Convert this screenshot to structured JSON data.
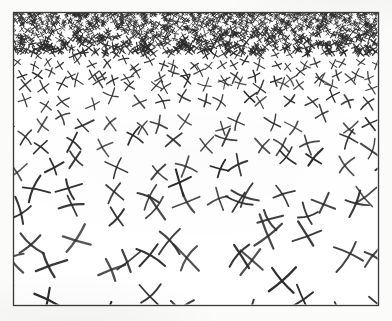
{
  "figure": {
    "medium": "pen-and-ink drawing, scanned",
    "canvas": {
      "width": 392,
      "height": 321
    },
    "background_color": "#fbfbf9",
    "ink_color": "#2b2b2b"
  },
  "frame": {
    "label": "drawing-border",
    "x": 13,
    "y": 12,
    "width": 365,
    "height": 293,
    "stroke_color": "#3a3a3a",
    "stroke_width": 1.3,
    "fill_color": "#ffffff"
  },
  "chart_data": {
    "type": "scatter",
    "subtitle": "X-mark density and size gradient",
    "xlabel": "",
    "ylabel": "",
    "xlim": [
      0,
      1
    ],
    "ylim": [
      0,
      1
    ],
    "grid": false,
    "legend": "none",
    "marker": "x-cross",
    "annotations": [
      "Marks are smallest and most densely packed along the top edge",
      "Marks are largest and most widely spaced along the bottom edge",
      "Mark size varies smoothly with vertical position",
      "Bottom-row marks are clipped by the frame border"
    ],
    "gradient_bands": [
      {
        "band": 1,
        "y_top": 13,
        "y_bottom": 48,
        "mark_size_px": 5,
        "row_spacing_px": 6,
        "col_spacing_px": 7,
        "stroke_width": 0.9,
        "marks_per_row": 54
      },
      {
        "band": 2,
        "y_top": 48,
        "y_bottom": 78,
        "mark_size_px": 8,
        "row_spacing_px": 10,
        "col_spacing_px": 11,
        "stroke_width": 1.1,
        "marks_per_row": 34
      },
      {
        "band": 3,
        "y_top": 78,
        "y_bottom": 112,
        "mark_size_px": 12,
        "row_spacing_px": 15,
        "col_spacing_px": 17,
        "stroke_width": 1.3,
        "marks_per_row": 22
      },
      {
        "band": 4,
        "y_top": 112,
        "y_bottom": 152,
        "mark_size_px": 16,
        "row_spacing_px": 21,
        "col_spacing_px": 24,
        "stroke_width": 1.5,
        "marks_per_row": 16
      },
      {
        "band": 5,
        "y_top": 152,
        "y_bottom": 198,
        "mark_size_px": 20,
        "row_spacing_px": 27,
        "col_spacing_px": 31,
        "stroke_width": 1.7,
        "marks_per_row": 12
      },
      {
        "band": 6,
        "y_top": 198,
        "y_bottom": 250,
        "mark_size_px": 25,
        "row_spacing_px": 33,
        "col_spacing_px": 39,
        "stroke_width": 1.9,
        "marks_per_row": 10
      },
      {
        "band": 7,
        "y_top": 250,
        "y_bottom": 312,
        "mark_size_px": 30,
        "row_spacing_px": 39,
        "col_spacing_px": 46,
        "stroke_width": 2.1,
        "marks_per_row": 8
      }
    ],
    "size_profile": {
      "note": "mark size in px as a function of normalized depth t (0 = top edge, 1 = bottom edge)",
      "t": [
        0.0,
        0.15,
        0.3,
        0.45,
        0.6,
        0.75,
        0.9,
        1.0
      ],
      "size_px": [
        4.0,
        7.0,
        11.0,
        15.5,
        20.0,
        24.5,
        29.0,
        31.0
      ]
    },
    "density_profile": {
      "note": "marks per 1000 square px as a function of normalized depth t",
      "t": [
        0.0,
        0.15,
        0.3,
        0.45,
        0.6,
        0.75,
        0.9,
        1.0
      ],
      "marks_per_1000px2": [
        26.0,
        12.0,
        6.2,
        3.4,
        2.0,
        1.3,
        0.9,
        0.7
      ]
    },
    "rotation_jitter_deg": 28,
    "position_jitter_frac": 0.34,
    "curvature": "slight, hand-drawn bow on each stroke"
  },
  "render": {
    "seed": 20240517,
    "ink_color": "#2b2b2b",
    "ink_light": "#4a4a4a"
  }
}
